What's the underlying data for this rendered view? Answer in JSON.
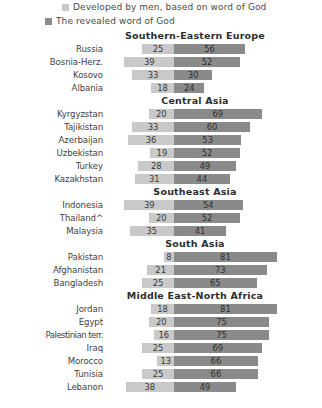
{
  "legend": {
    "items": [
      {
        "label": "Developed by men, based on word of God",
        "color": "#c9c9c9",
        "swatch_name": "legend-swatch-developed-by-men"
      },
      {
        "label": "The revealed word of God",
        "color": "#8a8a8a",
        "swatch_name": "legend-swatch-revealed-word"
      }
    ]
  },
  "chart_data": {
    "type": "bar",
    "title": "",
    "subtitle": "",
    "xlabel": "",
    "ylabel": "",
    "orientation": "horizontal",
    "stacked": true,
    "layout": "diverging-from-center",
    "grid": false,
    "legend_position": "top",
    "value_unit": "%",
    "xlim": [
      0,
      100
    ],
    "series": [
      {
        "name": "Developed by men, based on word of God",
        "color": "#c9c9c9",
        "direction": "left"
      },
      {
        "name": "The revealed word of God",
        "color": "#8a8a8a",
        "direction": "right"
      }
    ],
    "groups": [
      {
        "header": "Southern-Eastern  Europe",
        "categories": [
          "Russia",
          "Bosnia-Herz.",
          "Kosovo",
          "Albania"
        ],
        "values": {
          "Developed by men, based on word of God": [
            25,
            39,
            33,
            18
          ],
          "The revealed word of God": [
            56,
            52,
            30,
            24
          ]
        }
      },
      {
        "header": "Central Asia",
        "categories": [
          "Kyrgyzstan",
          "Tajikistan",
          "Azerbaijan",
          "Uzbekistan",
          "Turkey",
          "Kazakhstan"
        ],
        "values": {
          "Developed by men, based on word of God": [
            20,
            33,
            36,
            19,
            28,
            31
          ],
          "The revealed word of God": [
            69,
            60,
            53,
            52,
            49,
            44
          ]
        }
      },
      {
        "header": "Southeast  Asia",
        "categories": [
          "Indonesia",
          "Thailand^",
          "Malaysia"
        ],
        "values": {
          "Developed by men, based on word of God": [
            39,
            20,
            35
          ],
          "The revealed word of God": [
            54,
            52,
            41
          ]
        }
      },
      {
        "header": "South  Asia",
        "categories": [
          "Pakistan",
          "Afghanistan",
          "Bangladesh"
        ],
        "values": {
          "Developed by men, based on word of God": [
            8,
            21,
            25
          ],
          "The revealed word of God": [
            81,
            73,
            65
          ]
        }
      },
      {
        "header": "Middle East-North  Africa",
        "categories": [
          "Jordan",
          "Egypt",
          "Palestinian terr.",
          "Iraq",
          "Morocco",
          "Tunisia",
          "Lebanon"
        ],
        "values": {
          "Developed by men, based on word of God": [
            18,
            20,
            16,
            25,
            13,
            25,
            38
          ],
          "The revealed word of God": [
            81,
            75,
            75,
            69,
            66,
            66,
            49
          ]
        }
      }
    ]
  }
}
